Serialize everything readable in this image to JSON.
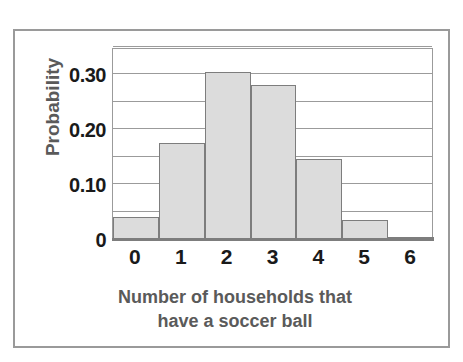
{
  "chart_data": {
    "type": "bar",
    "title": "",
    "subtitle": "",
    "xlabel_lines": [
      "Number of households that",
      "have a soccer ball"
    ],
    "xlabel": "Number of households that have a soccer ball",
    "ylabel": "Probability",
    "categories": [
      "0",
      "1",
      "2",
      "3",
      "4",
      "5",
      "6"
    ],
    "values": [
      0.04,
      0.175,
      0.305,
      0.28,
      0.145,
      0.035,
      0.003
    ],
    "x_tick_labels": [
      "0",
      "1",
      "2",
      "3",
      "4",
      "5",
      "6"
    ],
    "y_tick_labels": [
      "0.30",
      "0.20",
      "0.10",
      "0"
    ],
    "y_tick_values": [
      0.3,
      0.2,
      0.1,
      0
    ],
    "gridline_values": [
      0.35,
      0.3,
      0.25,
      0.2,
      0.15,
      0.1,
      0.05
    ],
    "ylim": [
      0,
      0.35
    ],
    "y_gridline_step": 0.05,
    "grid": "horizontal",
    "legend": "none",
    "bar_fill_color": "#dcdcdc",
    "bar_border_color": "#7d7d7d",
    "gridline_color": "#9b9b9b",
    "axis_text_color": "#1a1a1a",
    "axis_title_color": "#5a5a5a",
    "frame_color": "#9a9a9a",
    "background_color": "#ffffff"
  }
}
